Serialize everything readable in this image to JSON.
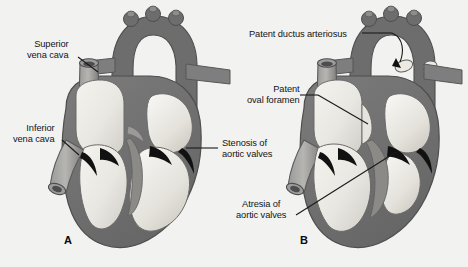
{
  "figure": {
    "background_color": "#f2f2f1",
    "style": "grayscale anatomical illustration",
    "panels": [
      {
        "letter": "A",
        "name": "panel-a",
        "description": "Heart with stenosis of aortic valves"
      },
      {
        "letter": "B",
        "name": "panel-b",
        "description": "Heart with atresia of aortic valves, patent ductus arteriosus and patent oval foramen"
      }
    ]
  },
  "labels": {
    "superior_vena_cava": "Superior\nvena cava",
    "superior_vena_cava_line1": "Superior",
    "superior_vena_cava_line2": "vena cava",
    "inferior_vena_cava_line1": "Inferior",
    "inferior_vena_cava_line2": "vena cava",
    "stenosis_line1": "Stenosis of",
    "stenosis_line2": "aortic valves",
    "atresia_line1": "Atresia of",
    "atresia_line2": "aortic valves",
    "patent_ductus_arteriosus": "Patent ductus arteriosus",
    "patent_oval_foramen_line1": "Patent",
    "patent_oval_foramen_line2": "oval foramen"
  },
  "colors": {
    "background": "#f2f2f1",
    "myocardium_dark": "#6d6d6d",
    "myocardium_mid": "#7b7b7b",
    "vessel_gray": "#8a8a8a",
    "chamber_light": "#eceae5",
    "chamber_shade": "#d4d2cc",
    "valve_black": "#111111",
    "outline": "#4a4a4a",
    "leader_line": "#1a1a1a",
    "text": "#141414"
  }
}
